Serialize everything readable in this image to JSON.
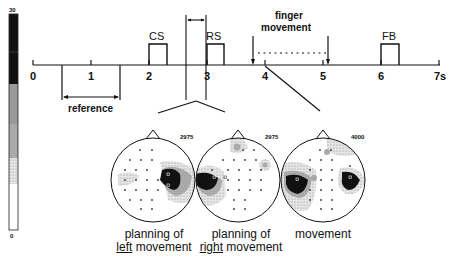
{
  "colorbar": {
    "max_label": "30",
    "min_label": "0",
    "segments": [
      {
        "shade": "#111111"
      },
      {
        "shade": "#9a9a9a"
      },
      {
        "shade": "#c4c4c4"
      },
      {
        "shade": "#e2e2e2"
      },
      {
        "shade": "#ffffff"
      }
    ]
  },
  "timeline": {
    "ticks": [
      "0",
      "1",
      "2",
      "3",
      "4",
      "5",
      "6",
      "7s"
    ],
    "events": {
      "cs": "CS",
      "rs": "RS",
      "fb": "FB",
      "finger_line1": "finger",
      "finger_line2": "movement",
      "reference": "reference"
    }
  },
  "maps": [
    {
      "value": "2975",
      "caption_line1": "planning of",
      "caption_pre": "",
      "caption_ul": "left",
      "caption_post": " movement"
    },
    {
      "value": "2975",
      "caption_line1": "planning of",
      "caption_pre": "",
      "caption_ul": "right",
      "caption_post": " movement"
    },
    {
      "value": "4000",
      "caption_line1": "movement",
      "caption_pre": "",
      "caption_ul": "",
      "caption_post": ""
    }
  ]
}
